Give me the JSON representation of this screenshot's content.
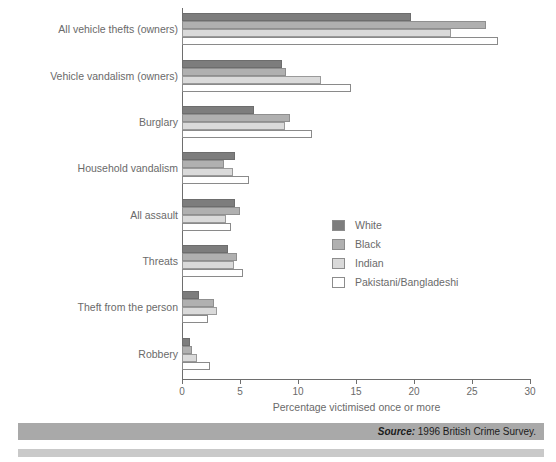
{
  "chart_data": {
    "type": "bar",
    "orientation": "horizontal",
    "title": "",
    "xlabel": "Percentage victimised once or more",
    "ylabel": "",
    "xlim": [
      0,
      30
    ],
    "xticks": [
      0,
      5,
      10,
      15,
      20,
      25,
      30
    ],
    "grid": false,
    "legend_position": "middle-right inside plot",
    "categories": [
      "All vehicle thefts (owners)",
      "Vehicle vandalism (owners)",
      "Burglary",
      "Household vandalism",
      "All assault",
      "Threats",
      "Theft from the person",
      "Robbery"
    ],
    "series": [
      {
        "name": "White",
        "color": "#7d7d7d",
        "values": [
          19.7,
          8.6,
          6.2,
          4.6,
          4.6,
          4.0,
          1.5,
          0.7
        ]
      },
      {
        "name": "Black",
        "color": "#b0b0b0",
        "values": [
          26.2,
          9.0,
          9.3,
          3.6,
          5.0,
          4.7,
          2.8,
          0.9
        ]
      },
      {
        "name": "Indian",
        "color": "#dadada",
        "values": [
          23.2,
          12.0,
          8.9,
          4.4,
          3.8,
          4.5,
          3.0,
          1.3
        ]
      },
      {
        "name": "Pakistani/Bangladeshi",
        "color": "#ffffff",
        "values": [
          27.2,
          14.6,
          11.2,
          5.8,
          4.2,
          5.3,
          2.2,
          2.4
        ]
      }
    ]
  },
  "source": {
    "label": "Source:",
    "text": " 1996 British Crime Survey."
  }
}
